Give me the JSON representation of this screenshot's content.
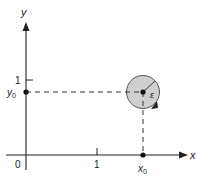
{
  "diagram": {
    "axes": {
      "x_label": "x",
      "y_label": "y",
      "origin_label": "0",
      "x_tick_label": "1",
      "y_tick_label": "1"
    },
    "point": {
      "x_label": "x",
      "x_subscript": "0",
      "y_label": "y",
      "y_subscript": "0"
    },
    "neighborhood": {
      "radius_label": "ε",
      "fill_color": "#cfcfcf",
      "stroke_color": "#555555"
    },
    "colors": {
      "axis": "#222222",
      "dashed": "#333333"
    }
  }
}
